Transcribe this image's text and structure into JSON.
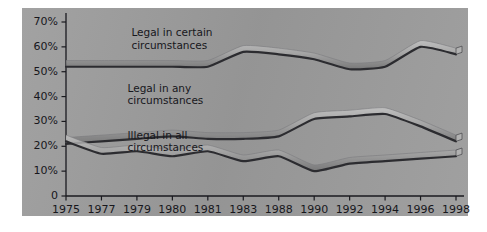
{
  "figure": {
    "background_color": "#ffffff",
    "panel_color": "#9b9b9b",
    "axis_color": "#1a1a1f",
    "text_color": "#17171c"
  },
  "chart_data": {
    "type": "line",
    "title": "",
    "subtitle": "",
    "xlabel": "",
    "ylabel": "",
    "grid": false,
    "legend_position": "inline-annotations",
    "x": [
      "1975",
      "1977",
      "1979",
      "1980",
      "1981",
      "1983",
      "1988",
      "1990",
      "1992",
      "1994",
      "1996",
      "1998"
    ],
    "xtick_labels": [
      "1975",
      "1977",
      "1979",
      "1980",
      "1981",
      "1983",
      "1988",
      "1990",
      "1992",
      "1994",
      "1996",
      "1998"
    ],
    "ytick_labels": [
      "0",
      "10%",
      "20%",
      "30%",
      "40%",
      "50%",
      "60%",
      "70%"
    ],
    "ytick_values": [
      0,
      10,
      20,
      30,
      40,
      50,
      60,
      70
    ],
    "ylim": [
      0,
      70
    ],
    "yunit": "%",
    "series": [
      {
        "name": "Legal in certain circumstances",
        "color": "#2c2c30",
        "highlight_color": "#c3c3c3",
        "label_x_pct": 26,
        "label_y_pct": 15,
        "values": [
          52,
          52,
          52,
          52,
          52,
          58,
          57,
          55,
          51,
          52,
          60,
          57
        ]
      },
      {
        "name": "Legal in any circumstances",
        "color": "#2c2c30",
        "highlight_color": "#c3c3c3",
        "label_x_pct": 25,
        "label_y_pct": 47,
        "values": [
          21,
          22,
          23,
          24,
          23,
          23,
          24,
          31,
          32,
          33,
          28,
          22
        ]
      },
      {
        "name": "Illegal in all circumstances",
        "color": "#2c2c30",
        "highlight_color": "#c3c3c3",
        "label_x_pct": 25,
        "label_y_pct": 74,
        "values": [
          22,
          17,
          18,
          16,
          18,
          14,
          16,
          10,
          13,
          14,
          15,
          16
        ]
      }
    ],
    "annotations": [
      {
        "text": "Legal in certain\ncircumstances",
        "series": 0
      },
      {
        "text": "Legal in any\ncircumstances",
        "series": 1
      },
      {
        "text": "Illegal in all\ncircumstances",
        "series": 2
      }
    ]
  }
}
